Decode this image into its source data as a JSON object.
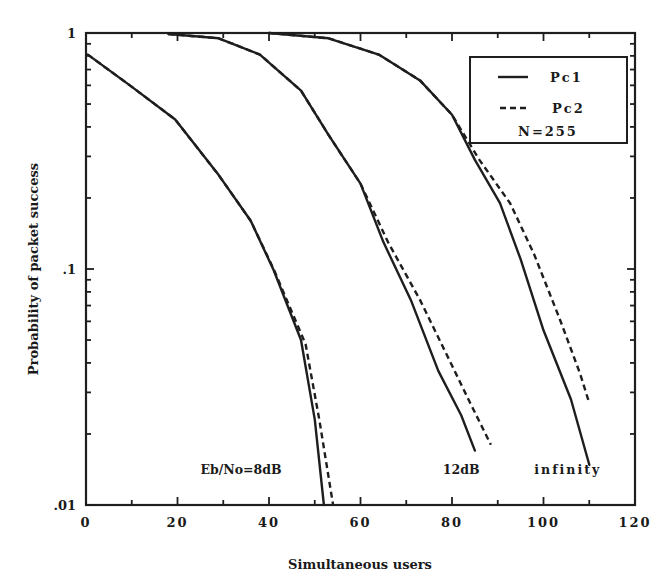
{
  "chart_data": {
    "type": "line",
    "title": "",
    "xlabel": "Simultaneous users",
    "ylabel": "Probability of packet success",
    "xlim": [
      0,
      120
    ],
    "ylim": [
      0.01,
      1
    ],
    "yscale": "log",
    "xticks": [
      0,
      20,
      40,
      60,
      80,
      100,
      120
    ],
    "xtick_labels": [
      "0",
      "20",
      "40",
      "60",
      "80",
      "100",
      "120"
    ],
    "yticks": [
      0.01,
      0.1,
      1
    ],
    "ytick_labels": [
      ".01",
      ".1",
      "1"
    ],
    "grid": false,
    "legend": {
      "position": "upper right",
      "entries": [
        {
          "label": "Pc1",
          "style": "solid"
        },
        {
          "label": "Pc2",
          "style": "dashed"
        }
      ],
      "note": "N=255"
    },
    "annotations": [
      {
        "text": "Eb/No=8dB",
        "x": 25,
        "y": 0.0135
      },
      {
        "text": "12dB",
        "x": 78,
        "y": 0.0135
      },
      {
        "text": "infinity",
        "x": 98,
        "y": 0.0135
      }
    ],
    "series": [
      {
        "name": "Pc1",
        "group": "Eb/No=8dB",
        "style": "solid",
        "x": [
          0.4,
          9.6,
          19.5,
          29,
          36,
          41,
          47,
          50,
          52
        ],
        "y": [
          0.81,
          0.6,
          0.43,
          0.25,
          0.16,
          0.099,
          0.05,
          0.023,
          0.01
        ]
      },
      {
        "name": "Pc2",
        "group": "Eb/No=8dB",
        "style": "dashed",
        "x": [
          0.4,
          9.6,
          19.5,
          29,
          36,
          41,
          48,
          51,
          54
        ],
        "y": [
          0.81,
          0.6,
          0.43,
          0.25,
          0.16,
          0.1,
          0.048,
          0.023,
          0.01
        ]
      },
      {
        "name": "Pc1",
        "group": "12dB",
        "style": "solid",
        "x": [
          18,
          29,
          38,
          47,
          53,
          60,
          65,
          71,
          77,
          82,
          85
        ],
        "y": [
          0.99,
          0.95,
          0.81,
          0.57,
          0.37,
          0.23,
          0.13,
          0.074,
          0.037,
          0.024,
          0.017
        ]
      },
      {
        "name": "Pc2",
        "group": "12dB",
        "style": "dashed",
        "x": [
          18,
          29,
          38,
          47,
          53,
          60,
          66,
          73,
          80,
          84,
          88.5
        ],
        "y": [
          0.99,
          0.95,
          0.81,
          0.57,
          0.37,
          0.23,
          0.13,
          0.074,
          0.039,
          0.027,
          0.018
        ]
      },
      {
        "name": "Pc1",
        "group": "infinity",
        "style": "solid",
        "x": [
          40,
          53,
          64,
          73,
          80,
          85,
          90.5,
          95,
          100,
          106,
          110
        ],
        "y": [
          1.0,
          0.95,
          0.81,
          0.63,
          0.45,
          0.29,
          0.19,
          0.11,
          0.055,
          0.028,
          0.0148
        ]
      },
      {
        "name": "Pc2",
        "group": "infinity",
        "style": "dashed",
        "x": [
          40,
          53,
          64,
          73,
          80,
          86,
          92.7,
          98,
          103.6,
          108,
          110
        ],
        "y": [
          1.0,
          0.95,
          0.81,
          0.63,
          0.45,
          0.29,
          0.19,
          0.115,
          0.061,
          0.036,
          0.027
        ]
      }
    ]
  },
  "layout": {
    "plot": {
      "left": 86,
      "top": 33,
      "right": 635,
      "bottom": 505
    },
    "line_color": "#1e1e1e"
  }
}
